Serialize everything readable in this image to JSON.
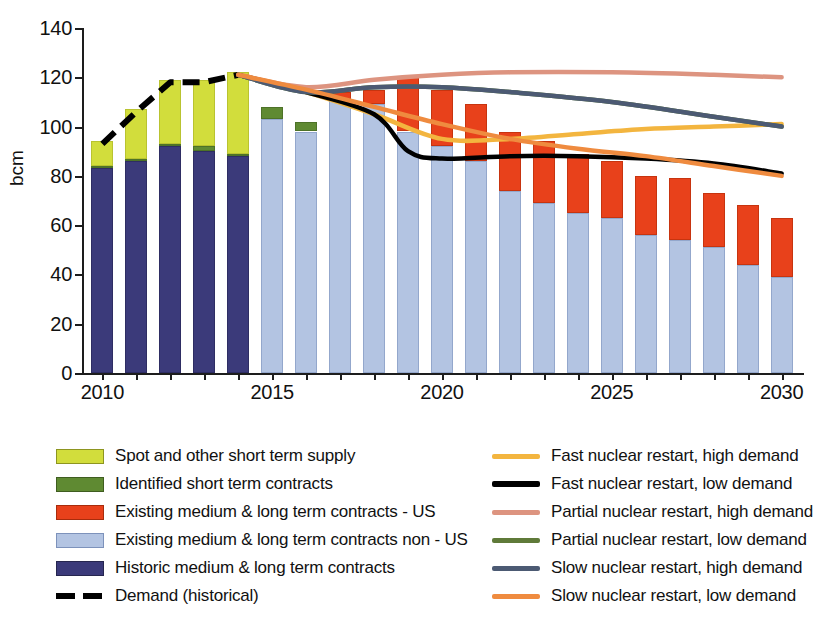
{
  "chart_data": {
    "type": "bar",
    "title": "",
    "subtitle": "",
    "xlabel": "",
    "ylabel": "bcm",
    "ylim": [
      0,
      140
    ],
    "xlim": [
      2009.4,
      2030.6
    ],
    "ytick_values": [
      0,
      20,
      40,
      60,
      80,
      100,
      120,
      140
    ],
    "xtick_values": [
      2010,
      2015,
      2020,
      2025,
      2030
    ],
    "grid": false,
    "legend_position": "below",
    "categories": [
      2010,
      2011,
      2012,
      2013,
      2014,
      2015,
      2016,
      2017,
      2018,
      2019,
      2020,
      2021,
      2022,
      2023,
      2024,
      2025,
      2026,
      2027,
      2028,
      2029,
      2030
    ],
    "stacked_series": [
      {
        "name": "Historic medium & long term contracts",
        "color": "#3b3a7a",
        "values": [
          83,
          86,
          92,
          90,
          88,
          0,
          0,
          0,
          0,
          0,
          0,
          0,
          0,
          0,
          0,
          0,
          0,
          0,
          0,
          0,
          0
        ]
      },
      {
        "name": "Existing medium & long term contracts non - US",
        "color": "#b3c4e2",
        "values": [
          0,
          0,
          0,
          0,
          0,
          103,
          98,
          111,
          109,
          98,
          92,
          86,
          74,
          69,
          65,
          63,
          56,
          54,
          51,
          44,
          39
        ]
      },
      {
        "name": "Existing medium & long term contracts - US",
        "color": "#e8411b",
        "values": [
          0,
          0,
          0,
          0,
          0,
          0,
          0,
          3,
          6,
          22,
          23,
          23,
          24,
          25,
          24,
          23,
          24,
          25,
          22,
          24,
          24
        ]
      },
      {
        "name": "Identified short term contracts",
        "color": "#5f8a32",
        "values": [
          1,
          1,
          1,
          2,
          1,
          5,
          4,
          0,
          0,
          0,
          0,
          0,
          0,
          0,
          0,
          0,
          0,
          0,
          0,
          0,
          0
        ]
      },
      {
        "name": "Spot and other short term supply",
        "color": "#d2dd3c",
        "values": [
          10,
          20,
          26,
          27,
          33,
          0,
          0,
          0,
          0,
          0,
          0,
          0,
          0,
          0,
          0,
          0,
          0,
          0,
          0,
          0,
          0
        ]
      }
    ],
    "bar_totals": [
      94,
      107,
      119,
      119,
      122,
      108,
      102,
      114,
      115,
      120,
      115,
      109,
      98,
      94,
      89,
      86,
      80,
      79,
      73,
      68,
      63
    ],
    "line_series": [
      {
        "name": "Demand (historical)",
        "color": "#000000",
        "style": "dashed",
        "x": [
          2010,
          2011,
          2012,
          2013,
          2014
        ],
        "y": [
          93,
          106,
          118,
          118,
          121
        ]
      },
      {
        "name": "Fast nuclear restart, high demand",
        "color": "#f3b53f",
        "style": "solid",
        "x": [
          2014,
          2016,
          2018,
          2020,
          2022,
          2024,
          2026,
          2028,
          2030
        ],
        "y": [
          121,
          114,
          105,
          95,
          95,
          97,
          99,
          100,
          101
        ]
      },
      {
        "name": "Fast nuclear restart, low  demand",
        "color": "#000000",
        "style": "solid",
        "x": [
          2014,
          2016,
          2018,
          2019,
          2020,
          2022,
          2024,
          2026,
          2028,
          2030
        ],
        "y": [
          121,
          114,
          105,
          90,
          87,
          88,
          88,
          87,
          85,
          81
        ]
      },
      {
        "name": "Partial nuclear restart, high demand",
        "color": "#dd9480",
        "style": "solid",
        "x": [
          2014,
          2016,
          2018,
          2020,
          2022,
          2025,
          2028,
          2030
        ],
        "y": [
          121,
          116,
          119,
          121,
          122,
          122,
          121,
          120
        ]
      },
      {
        "name": "Partial nuclear restart, low demand",
        "color": "#5f7a39",
        "style": "solid",
        "x": [
          2014,
          2016,
          2018,
          2020,
          2022,
          2025,
          2028,
          2030
        ],
        "y": [
          121,
          114,
          116,
          116,
          114,
          110,
          104,
          100
        ]
      },
      {
        "name": "Slow nuclear restart, high demand",
        "color": "#4c5a73",
        "style": "solid",
        "x": [
          2014,
          2016,
          2018,
          2020,
          2022,
          2025,
          2028,
          2030
        ],
        "y": [
          121,
          114,
          116,
          116,
          114,
          110,
          104,
          100
        ]
      },
      {
        "name": "Slow nuclear restart, low demand",
        "color": "#ef8b3f",
        "style": "solid",
        "x": [
          2014,
          2016,
          2018,
          2020,
          2022,
          2024,
          2026,
          2028,
          2030
        ],
        "y": [
          121,
          115,
          108,
          101,
          95,
          91,
          88,
          84,
          80
        ]
      }
    ]
  },
  "axes": {
    "y_title": "bcm",
    "y_ticks": [
      "0",
      "20",
      "40",
      "60",
      "80",
      "100",
      "120",
      "140"
    ],
    "x_ticks": [
      "2010",
      "2015",
      "2020",
      "2025",
      "2030"
    ]
  },
  "legend_left": {
    "items": [
      {
        "label": "Spot and other short term supply",
        "swatch": "sw-spot",
        "color": "#d2dd3c"
      },
      {
        "label": "Identified short term contracts",
        "swatch": "sw-identified",
        "color": "#5f8a32"
      },
      {
        "label": "Existing medium & long term contracts - US",
        "swatch": "sw-us",
        "color": "#e8411b"
      },
      {
        "label": "Existing medium & long term contracts non - US",
        "swatch": "sw-nonus",
        "color": "#b3c4e2"
      },
      {
        "label": "Historic medium & long term contracts",
        "swatch": "sw-historic",
        "color": "#3b3a7a"
      },
      {
        "label": "Demand (historical)",
        "swatch": "sw-dashed",
        "color": "#000000"
      }
    ]
  },
  "legend_right": {
    "items": [
      {
        "label": "Fast nuclear restart, high demand",
        "color": "#f3b53f"
      },
      {
        "label": "Fast nuclear restart, low  demand",
        "color": "#000000"
      },
      {
        "label": "Partial nuclear restart, high demand",
        "color": "#dd9480"
      },
      {
        "label": "Partial nuclear restart, low demand",
        "color": "#5f7a39"
      },
      {
        "label": "Slow nuclear restart, high demand",
        "color": "#4c5a73"
      },
      {
        "label": "Slow nuclear restart, low demand",
        "color": "#ef8b3f"
      }
    ]
  }
}
